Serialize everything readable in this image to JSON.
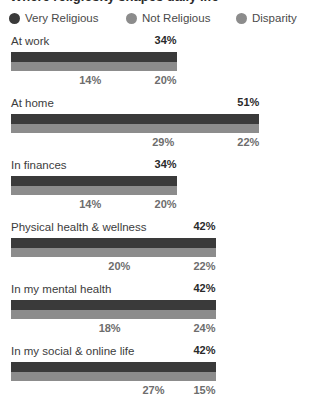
{
  "title": "Where religiosity shapes daily life",
  "legend": {
    "items": [
      {
        "label": "Very Religious",
        "color": "#3a3a3a",
        "icon": "legend-dot-icon"
      },
      {
        "label": "Not Religious",
        "color": "#8c8c8c",
        "icon": "legend-dot-icon"
      },
      {
        "label": "Disparity",
        "color": "#8c8c8c",
        "icon": "legend-dot-icon"
      }
    ]
  },
  "chart_data": {
    "type": "bar",
    "orientation": "horizontal",
    "stacked": true,
    "title": "Where religiosity shapes daily life",
    "xlabel": "",
    "ylabel": "",
    "xlim": [
      0,
      55
    ],
    "grid": false,
    "legend_position": "top",
    "categories": [
      "At work",
      "At home",
      "In finances",
      "Physical health & wellness",
      "In my mental health",
      "In my social & online life"
    ],
    "series": [
      {
        "name": "Very Religious",
        "color": "#3a3a3a",
        "values": [
          34,
          51,
          34,
          42,
          42,
          42
        ]
      },
      {
        "name": "Not Religious",
        "color": "#8c8c8c",
        "values": [
          14,
          29,
          14,
          20,
          18,
          27
        ]
      },
      {
        "name": "Disparity",
        "color": "#8c8c8c",
        "values": [
          20,
          22,
          20,
          22,
          24,
          15
        ]
      }
    ]
  },
  "rows": [
    {
      "category": "At work",
      "very_religious": "34%",
      "very_religious_value": 34,
      "not_religious": "14%",
      "not_religious_value": 14,
      "disparity": "20%",
      "disparity_value": 20
    },
    {
      "category": "At home",
      "very_religious": "51%",
      "very_religious_value": 51,
      "not_religious": "29%",
      "not_religious_value": 29,
      "disparity": "22%",
      "disparity_value": 22
    },
    {
      "category": "In finances",
      "very_religious": "34%",
      "very_religious_value": 34,
      "not_religious": "14%",
      "not_religious_value": 14,
      "disparity": "20%",
      "disparity_value": 20
    },
    {
      "category": "Physical health & wellness",
      "very_religious": "42%",
      "very_religious_value": 42,
      "not_religious": "20%",
      "not_religious_value": 20,
      "disparity": "22%",
      "disparity_value": 22
    },
    {
      "category": "In my mental health",
      "very_religious": "42%",
      "very_religious_value": 42,
      "not_religious": "18%",
      "not_religious_value": 18,
      "disparity": "24%",
      "disparity_value": 24
    },
    {
      "category": "In my social & online life",
      "very_religious": "42%",
      "very_religious_value": 42,
      "not_religious": "27%",
      "not_religious_value": 27,
      "disparity": "15%",
      "disparity_value": 15
    }
  ],
  "scale": {
    "bar_left_px": 11,
    "px_per_unit": 4.87
  }
}
